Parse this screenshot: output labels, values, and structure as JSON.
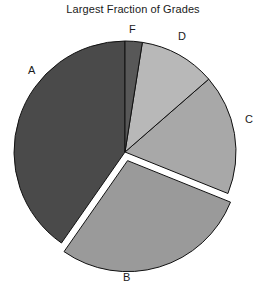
{
  "chart_data": {
    "type": "pie",
    "title": "Largest Fraction of Grades",
    "xlabel": "",
    "ylabel": "",
    "legend": "none",
    "grid": false,
    "categories": [
      "A",
      "B",
      "C",
      "D",
      "F"
    ],
    "values": [
      40.3,
      28.6,
      17.5,
      11.1,
      2.5
    ],
    "units": "percent",
    "start_angle_deg": 90,
    "direction": "counterclockwise",
    "exploded_slice": "B",
    "colors": {
      "A": "#4a4a4a",
      "B": "#9a9a9a",
      "C": "#a8a8a8",
      "D": "#b8b8b8",
      "F": "#585858"
    },
    "slice_labels": [
      {
        "key": "A",
        "text": "A",
        "x": 28,
        "y": 65
      },
      {
        "key": "F",
        "text": "F",
        "x": 129,
        "y": 24
      },
      {
        "key": "D",
        "text": "D",
        "x": 178,
        "y": 31
      },
      {
        "key": "C",
        "text": "C",
        "x": 245,
        "y": 114
      },
      {
        "key": "B",
        "text": "B",
        "x": 123,
        "y": 272
      }
    ],
    "geometry": {
      "center_x": 125,
      "center_y": 152,
      "radius": 111,
      "explode_offset": 9,
      "stroke_color": "#111111",
      "stroke_width": 1
    },
    "annotations": []
  }
}
